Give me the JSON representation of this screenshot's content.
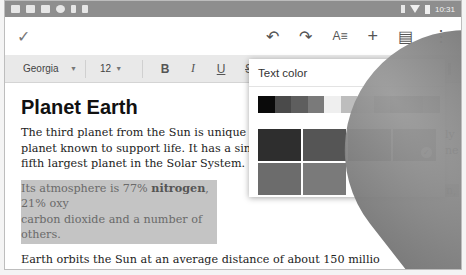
{
  "status_bar": {
    "left_icons": [
      "gallery-icon",
      "email-icon",
      "calendar-icon",
      "sync-icon",
      "download-icon",
      "play-store-icon"
    ],
    "right_icons": [
      "bluetooth-icon",
      "wifi-icon",
      "battery-icon"
    ],
    "time": "10:31"
  },
  "app_bar": {
    "done_icon": "✓",
    "undo_icon": "↶",
    "redo_icon": "↷",
    "text_format_icon": "A≡",
    "insert_icon": "+",
    "comment_icon": "▤",
    "more_icon": "⋮"
  },
  "format_bar": {
    "font": "Georgia",
    "font_caret": "▼",
    "size": "12",
    "size_caret": "▼",
    "bold": "B",
    "italic": "I",
    "underline": "U",
    "strikethrough": "S"
  },
  "document": {
    "title": "Planet Earth",
    "p1_line1": "The third planet from the Sun is unique in",
    "p1_line2": "planet known to support life. It has a single n",
    "p1_line3": "fifth largest planet in the Solar System.",
    "p2_pre": "Its atmosphere is 77% ",
    "p2_bold": "nitrogen",
    "p2_post": ", 21% oxy",
    "p2_line2": "carbon dioxide and a number of others.",
    "p3_line1": "Earth orbits the Sun at an average distance of about 150 millio",
    "p3_line2": "365.2564 solar days and has an orbital speed of about 107,000 km",
    "p3_line3": "per hour).",
    "right_fragment_1": "ly",
    "right_fragment_2": "ne",
    "right_fragment_3": "n,"
  },
  "text_color_panel": {
    "title": "Text color",
    "strip_colors": [
      "#0a0a0a",
      "#4a4a4a",
      "#5e5e5e",
      "#7a7a7a",
      "#efefef",
      "#bdbdbd",
      "#d6d6d6",
      "#7c7c7c",
      "#505050",
      "#5a5a5a",
      "#7e7e7e"
    ],
    "grid_colors": [
      "#2e2e2e",
      "#555555",
      "#4a4a4a",
      "#5c5c5c",
      "#6c6c6c",
      "#7a7a7a",
      "#ffffff",
      "#ffffff"
    ],
    "selected_index": 3
  }
}
